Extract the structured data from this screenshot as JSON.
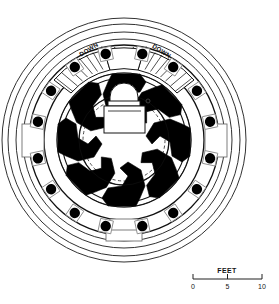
{
  "drawing": {
    "type": "architectural-floor-plan",
    "subject": "circular rotunda plan",
    "background_color": "#ffffff",
    "ink_color": "#000000"
  },
  "annotations": {
    "stair_left_label": "DOWN",
    "stair_right_label": "DOWN"
  },
  "scale_bar": {
    "title": "FEET",
    "ticks": [
      "0",
      "5",
      "10"
    ],
    "tick_values": [
      0,
      5,
      10
    ],
    "units": "FEET"
  },
  "geometry": {
    "center": {
      "cx": 124,
      "cy": 140
    },
    "outer_rings": [
      {
        "name": "outermost-circle",
        "r": 122
      },
      {
        "name": "second-circle",
        "r": 116
      },
      {
        "name": "third-circle",
        "r": 108
      },
      {
        "name": "fourth-circle",
        "r": 101
      }
    ],
    "colonnade_ring_radius": 88,
    "peristyle_inner_radius": 80,
    "cella_outer_radius": 66,
    "cella_inner_radius": 44,
    "dashed_circle_radius": 41,
    "column_count": 16,
    "column_dot_radius": 5.2,
    "column_square_size": 13,
    "wall_segment_count": 8
  },
  "elements": {
    "columns_label": "column",
    "wall_segment_label": "radial wall segment",
    "stair_label": "curved stair",
    "altar_label": "central altar block",
    "door_label": "doorway opening"
  },
  "columns": [
    {
      "index": 0,
      "angle_deg": -78
    },
    {
      "index": 1,
      "angle_deg": -56
    },
    {
      "index": 2,
      "angle_deg": -34
    },
    {
      "index": 3,
      "angle_deg": -12
    },
    {
      "index": 4,
      "angle_deg": 12
    },
    {
      "index": 5,
      "angle_deg": 34
    },
    {
      "index": 6,
      "angle_deg": 56
    },
    {
      "index": 7,
      "angle_deg": 78
    },
    {
      "index": 8,
      "angle_deg": 102
    },
    {
      "index": 9,
      "angle_deg": 124
    },
    {
      "index": 10,
      "angle_deg": 146
    },
    {
      "index": 11,
      "angle_deg": 168
    },
    {
      "index": 12,
      "angle_deg": 192
    },
    {
      "index": 13,
      "angle_deg": 214
    },
    {
      "index": 14,
      "angle_deg": 236
    },
    {
      "index": 15,
      "angle_deg": 258
    }
  ]
}
